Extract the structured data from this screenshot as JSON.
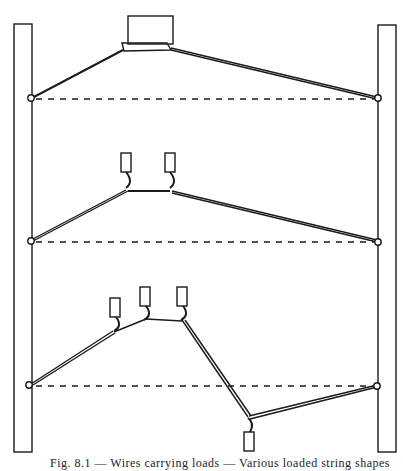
{
  "figure": {
    "caption": "Fig. 8.1 — Wires carrying loads — Various loaded string shapes",
    "panels": [
      {
        "name": "single-block-load",
        "loads": 1,
        "pivot_y": 99
      },
      {
        "name": "two-weight-load",
        "loads": 2,
        "pivot_y": 241
      },
      {
        "name": "four-weight-load",
        "loads": 4,
        "pivot_y": 385
      }
    ]
  },
  "colors": {
    "ink": "#1a1a1a",
    "paper": "#ffffff"
  }
}
